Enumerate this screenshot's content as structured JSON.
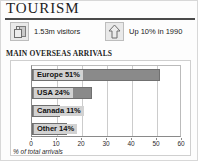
{
  "header": {
    "title": "TOURISM"
  },
  "stats": [
    {
      "icon": "luggage-icon",
      "label": "1.53m visitors"
    },
    {
      "icon": "up-arrow-icon",
      "label": "Up 10% in 1990"
    }
  ],
  "subhead": "MAIN OVERSEAS ARRIVALS",
  "axis_title": "% of total arrivals",
  "colors": {
    "bar_fill": "#8a8a8a",
    "bar_stroke": "#707070",
    "label_highlight": "#d2d2d2",
    "grid": "#cccccc",
    "axis": "#8a8a8a",
    "rule": "#4a4a4a"
  },
  "chart_data": {
    "type": "bar",
    "orientation": "horizontal",
    "title": "MAIN OVERSEAS ARRIVALS",
    "xlabel": "% of total arrivals",
    "ylabel": "",
    "xlim": [
      0,
      60
    ],
    "xticks": [
      0,
      10,
      20,
      30,
      40,
      50,
      60
    ],
    "xtick_labels": [
      "0",
      "10",
      "20",
      "30",
      "40",
      "50",
      "60"
    ],
    "grid": true,
    "legend": "none",
    "categories": [
      "Europe",
      "USA",
      "Canada",
      "Other"
    ],
    "values": [
      51,
      24,
      11,
      14
    ],
    "bar_labels": [
      "Europe 51%",
      "USA 24%",
      "Canada 11%",
      "Other 14%"
    ]
  }
}
